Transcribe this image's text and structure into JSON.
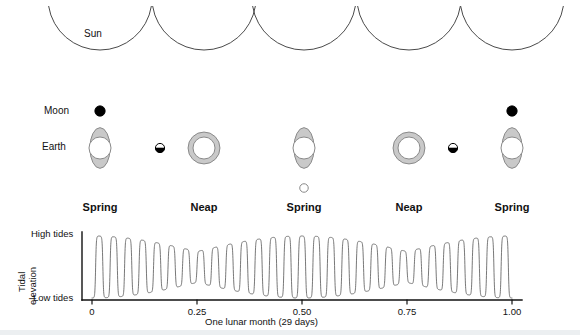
{
  "figure": {
    "sun_label": "Sun",
    "moon_label": "Moon",
    "earth_label": "Earth"
  },
  "colors": {
    "stroke": "#4a4a4a",
    "text": "#111111",
    "bulge_fill": "#c9c9c9",
    "bulge_stroke": "#8a8a8a",
    "moon_dark": "#000000",
    "moon_light": "#ffffff",
    "axis": "#111111",
    "wave": "#555555",
    "background": "#ffffff"
  },
  "configurations": [
    {
      "index": 0,
      "phase_label": "Spring",
      "moon_phase": "new-moon",
      "moon_position": "above-earth",
      "earth_shape": "bulged",
      "cx": 100
    },
    {
      "index": 1,
      "phase_label": "Neap",
      "moon_phase": "half-moon",
      "moon_position": "left-of-earth",
      "earth_shape": "ring",
      "cx": 204
    },
    {
      "index": 2,
      "phase_label": "Spring",
      "moon_phase": "full-moon",
      "moon_position": "below-earth",
      "earth_shape": "bulged",
      "cx": 304
    },
    {
      "index": 3,
      "phase_label": "Neap",
      "moon_phase": "half-moon",
      "moon_position": "right-of-earth",
      "earth_shape": "ring",
      "cx": 409
    },
    {
      "index": 4,
      "phase_label": "Spring",
      "moon_phase": "new-moon",
      "moon_position": "above-earth",
      "earth_shape": "bulged",
      "cx": 512
    }
  ],
  "chart_data": {
    "type": "line",
    "title": "",
    "xlabel": "One lunar month (29 days)",
    "ylabel": "Tidal elevation",
    "ylabel_lines": [
      "Tidal",
      "elevation"
    ],
    "ytick_labels": [
      "High tides",
      "Low tides"
    ],
    "ylim": [
      0,
      1
    ],
    "xlim": [
      0,
      1
    ],
    "grid": false,
    "legend": null,
    "xticks": [
      0,
      0.25,
      0.5,
      0.75,
      1.0
    ],
    "xtick_labels": [
      "0",
      "0.25",
      "0.50",
      "0.75",
      "1.00"
    ],
    "cycles_per_month": 29,
    "envelope": {
      "spring_positions": [
        0,
        0.5,
        1.0
      ],
      "neap_positions": [
        0.25,
        0.75
      ],
      "max_amplitude": 1.0,
      "min_amplitude": 0.5
    },
    "series": [
      {
        "name": "Tidal elevation",
        "x": [
          0,
          0.25,
          0.5,
          0.75,
          1.0
        ],
        "amplitude_envelope": [
          1.0,
          0.5,
          1.0,
          0.5,
          1.0
        ]
      }
    ]
  }
}
